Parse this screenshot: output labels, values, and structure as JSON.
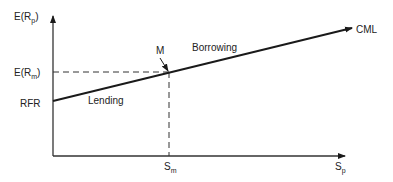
{
  "diagram": {
    "y_axis": {
      "label_main": "E(R",
      "label_sub": "p",
      "label_close": ")"
    },
    "x_axis": {
      "label_main": "S",
      "label_sub": "p"
    },
    "rfr_label": "RFR",
    "erm_label": {
      "main": "E(R",
      "sub": "m",
      "close": ")"
    },
    "sm_label": {
      "main": "S",
      "sub": "m"
    },
    "market_point_label": "M",
    "lending_label": "Lending",
    "borrowing_label": "Borrowing",
    "cml_label": "CML",
    "colors": {
      "line": "#1a1a1a",
      "dash": "#333333",
      "text": "#222222"
    }
  }
}
